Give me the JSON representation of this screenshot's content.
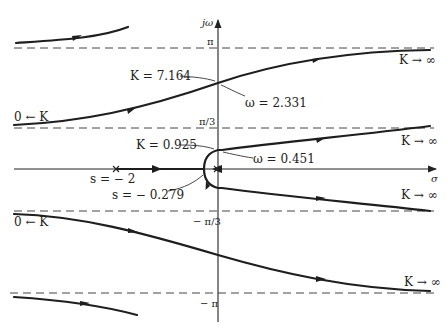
{
  "diagram": {
    "axes": {
      "vertical_label": "jω",
      "horizontal_label": "σ"
    },
    "asymptote_ticks": {
      "pi": "π",
      "pi_3": "π/3",
      "neg_pi_3": "− π/3",
      "neg_pi": "− π"
    },
    "annotations": {
      "k_cross_high": "K = 7.164",
      "w_cross_high": "ω = 2.331",
      "k_cross_low": "K = 0.925",
      "w_cross_low": "ω = 0.451",
      "pole": "s = − 2",
      "breakaway": "s = − 0.279",
      "k_start_upper": "0 ← K",
      "k_start_lower": "0 ← K",
      "k_inf_1": "K → ∞",
      "k_inf_2": "K → ∞",
      "k_inf_3": "K → ∞",
      "k_inf_4": "K → ∞"
    },
    "colors": {
      "locus": "#1e1e1e",
      "axis": "#333333",
      "asymptote": "#444444"
    }
  }
}
